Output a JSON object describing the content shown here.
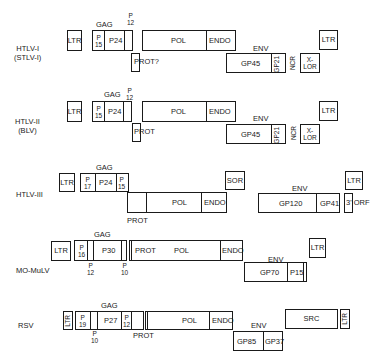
{
  "rows": [
    {
      "virus": "HTLV-I",
      "alt_name": "(STLV-I)",
      "labels": {
        "gag": "GAG",
        "p12_p": "P",
        "p12_n": "12",
        "prot": "PROT?",
        "env": "ENV",
        "ncr": "NCR"
      },
      "boxes": {
        "ltr5": "LTR",
        "p15_p": "P",
        "p15_n": "15",
        "p24": "P24",
        "pol": "POL",
        "endo": "ENDO",
        "gp45": "GP45",
        "gp21": "GP21",
        "xlor_a": "X-",
        "xlor_b": "LOR",
        "ltr3": "LTR"
      }
    },
    {
      "virus": "HTLV-II",
      "alt_name": "(BLV)",
      "labels": {
        "gag": "GAG",
        "p12_p": "P",
        "p12_n": "12",
        "prot": "PROT",
        "env": "ENV",
        "ncr": "NCR"
      },
      "boxes": {
        "ltr5": "LTR",
        "p15_p": "P",
        "p15_n": "15",
        "p24": "P24",
        "pol": "POL",
        "endo": "ENDO",
        "gp45": "GP45",
        "gp21": "GP21",
        "xlor_a": "X-",
        "xlor_b": "LOR",
        "ltr3": "LTR"
      }
    },
    {
      "virus": "HTLV-III",
      "labels": {
        "gag": "GAG",
        "prot": "PROT",
        "env": "ENV"
      },
      "boxes": {
        "ltr5": "LTR",
        "p17_p": "P",
        "p17_n": "17",
        "p24": "P24",
        "p15_p": "P",
        "p15_n": "15",
        "pol": "POL",
        "endo": "ENDO",
        "sor": "SOR",
        "gp120": "GP120",
        "gp41": "GP41",
        "orf3": "3' ORF",
        "ltr3": "LTR"
      }
    },
    {
      "virus": "MO-MuLV",
      "labels": {
        "gag": "GAG",
        "p12_p": "P",
        "p12_n": "12",
        "p10_p": "P",
        "p10_n": "10",
        "env": "ENV"
      },
      "boxes": {
        "ltr5": "LTR",
        "p16_p": "P",
        "p16_n": "16",
        "p30": "P30",
        "prot": "PROT",
        "pol": "POL",
        "endo": "ENDO",
        "gp70": "GP70",
        "p15": "P15",
        "ltr3": "LTR"
      }
    },
    {
      "virus": "RSV",
      "labels": {
        "gag": "GAG",
        "p10_p": "P",
        "p10_n": "10",
        "prot": "PROT",
        "env": "ENV"
      },
      "boxes": {
        "ltr5": "LTR",
        "p19_p": "P",
        "p19_n": "19",
        "p27": "P27",
        "p12_p": "P",
        "p12_n": "12",
        "pol": "POL",
        "endo": "ENDO",
        "gp85": "GP85",
        "gp37": "GP37",
        "src": "SRC",
        "ltr3": "LTR"
      }
    }
  ]
}
